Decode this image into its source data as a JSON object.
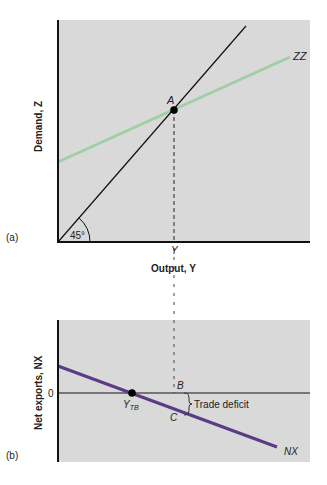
{
  "panel_a": {
    "tag": "(a)",
    "ylabel": "Demand, Z",
    "xlabel": "Output, Y",
    "x_tick": "Y",
    "angle_label": "45°",
    "point_label": "A",
    "curve_label": "ZZ",
    "colors": {
      "background": "#d9d9d9",
      "zz": "#9fcfa5",
      "line45": "#111111"
    }
  },
  "panel_b": {
    "tag": "(b)",
    "ylabel": "Net exports, NX",
    "zero_label": "0",
    "point_ytb": "Y",
    "point_ytb_sub": "TB",
    "point_b": "B",
    "point_c": "C",
    "annotation": "Trade deficit",
    "curve_label": "NX",
    "colors": {
      "background": "#d9d9d9",
      "nx": "#5b3a86"
    }
  }
}
